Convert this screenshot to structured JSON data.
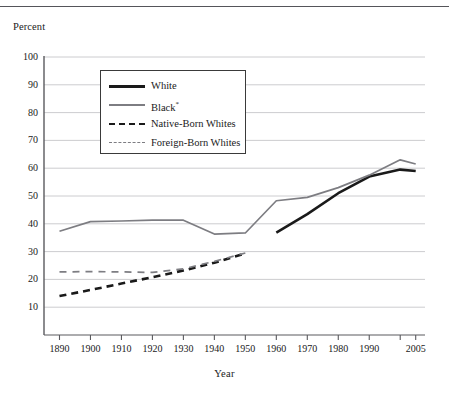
{
  "figure": {
    "cropped_header_text": "",
    "y_axis_title": "Percent",
    "x_axis_title": "Year"
  },
  "legend": {
    "entries": [
      {
        "label": "White",
        "style": "solid",
        "color": "#1a1a1a",
        "width": 2.6
      },
      {
        "label": "Black",
        "suffix": "*",
        "style": "solid",
        "color": "#7d7d82",
        "width": 1.7
      },
      {
        "label": "Native-Born Whites",
        "style": "dashed",
        "color": "#1a1a1a",
        "width": 2.6
      },
      {
        "label": "Foreign-Born Whites",
        "style": "dashed",
        "color": "#7d7d82",
        "width": 1.7
      }
    ]
  },
  "chart_data": {
    "type": "line",
    "title": "",
    "xlabel": "Year",
    "ylabel": "Percent",
    "xlim": [
      1885,
      2008
    ],
    "ylim": [
      0,
      100
    ],
    "yticks": [
      10,
      20,
      30,
      40,
      50,
      60,
      70,
      80,
      90,
      100
    ],
    "ytick_labels": [
      "10",
      "20",
      "30",
      "40",
      "50",
      "60",
      "70",
      "80",
      "90",
      "100"
    ],
    "xticks": [
      1890,
      1900,
      1910,
      1920,
      1930,
      1940,
      1950,
      1960,
      1970,
      1980,
      1990,
      2000,
      2005
    ],
    "xtick_labels": [
      "1890",
      "1900",
      "1910",
      "1920",
      "1930",
      "1940",
      "1950",
      "1960",
      "1970",
      "1980",
      "1990",
      "",
      "2005"
    ],
    "grid": "horizontal",
    "legend_position": "upper-left-inside",
    "series": [
      {
        "name": "White",
        "color": "#1a1a1a",
        "style": "solid",
        "width": 2.6,
        "x": [
          1960,
          1970,
          1980,
          1990,
          2000,
          2005
        ],
        "values": [
          36.8,
          43.5,
          51.0,
          57.0,
          59.5,
          59.0
        ]
      },
      {
        "name": "Black*",
        "color": "#7d7d82",
        "style": "solid",
        "width": 1.7,
        "x": [
          1890,
          1900,
          1910,
          1920,
          1930,
          1940,
          1950,
          1960,
          1970,
          1980,
          1990,
          2000,
          2005
        ],
        "values": [
          37.3,
          40.8,
          41.0,
          41.3,
          41.3,
          36.3,
          36.7,
          48.3,
          49.5,
          53.0,
          57.5,
          63.0,
          61.5
        ]
      },
      {
        "name": "Native-Born Whites",
        "color": "#1a1a1a",
        "style": "dashed",
        "width": 2.6,
        "x": [
          1890,
          1900,
          1910,
          1920,
          1930,
          1940,
          1950
        ],
        "values": [
          14.0,
          16.2,
          18.5,
          20.8,
          23.2,
          26.0,
          29.4
        ]
      },
      {
        "name": "Foreign-Born Whites",
        "color": "#7d7d82",
        "style": "dashed",
        "width": 1.7,
        "x": [
          1890,
          1900,
          1910,
          1920,
          1930,
          1940,
          1950
        ],
        "values": [
          22.7,
          22.8,
          22.7,
          22.5,
          23.8,
          26.5,
          29.5
        ]
      }
    ]
  }
}
